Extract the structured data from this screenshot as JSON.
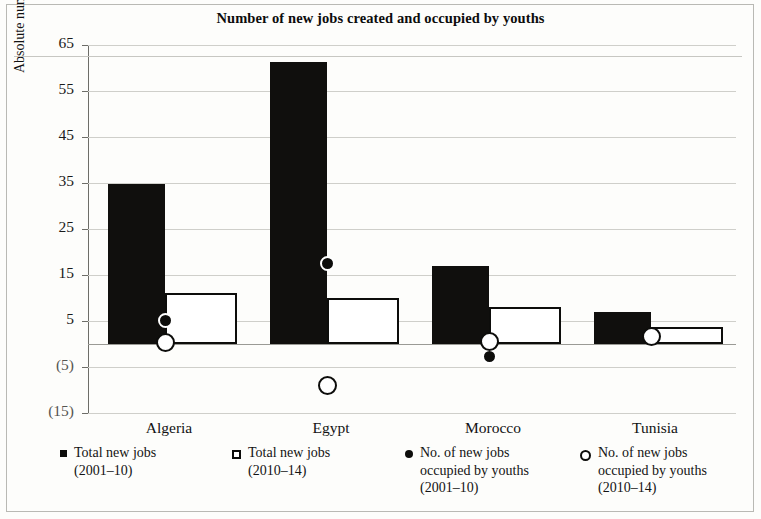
{
  "chart_data": {
    "type": "bar",
    "title": "Number of new jobs created and occupied by youths",
    "xlabel": "",
    "ylabel": "Absolute number in 100,000",
    "categories": [
      "Algeria",
      "Egypt",
      "Morocco",
      "Tunisia"
    ],
    "ylim": [
      -15,
      65
    ],
    "yticks": [
      65,
      55,
      45,
      35,
      25,
      15,
      5,
      -5,
      -15
    ],
    "ytick_labels": [
      "65",
      "55",
      "45",
      "35",
      "25",
      "15",
      "5",
      "(5)",
      "(15)"
    ],
    "grid": true,
    "legend_position": "bottom",
    "series": [
      {
        "name": "Total new jobs (2001–10)",
        "mark": "bar-filled",
        "color": "#0d0d0b",
        "values": [
          34.7,
          61.3,
          17.0,
          7.0
        ]
      },
      {
        "name": "Total new jobs (2010–14)",
        "mark": "bar-open",
        "color": "#ffffff",
        "values": [
          11.1,
          10.0,
          8.0,
          3.7
        ]
      },
      {
        "name": "No. of new jobs occupied by youths (2001–10)",
        "mark": "circle-filled",
        "color": "#0d0d0b",
        "values": [
          5.2,
          17.5,
          -2.8,
          null
        ]
      },
      {
        "name": "No. of new jobs occupied by youths (2010–14)",
        "mark": "circle-open",
        "color": "#ffffff",
        "values": [
          0.4,
          -9.1,
          0.6,
          1.7
        ]
      }
    ]
  },
  "legend": [
    {
      "mark": "square-filled",
      "line1": "Total new jobs",
      "line2": "(2001–10)"
    },
    {
      "mark": "square-open",
      "line1": "Total new jobs",
      "line2": "(2010–14)"
    },
    {
      "mark": "circle-filled",
      "line1": "No. of new jobs",
      "line2": "occupied by youths",
      "line3": "(2001–10)"
    },
    {
      "mark": "circle-open",
      "line1": "No. of new jobs",
      "line2": "occupied by youths",
      "line3": "(2010–14)"
    }
  ]
}
